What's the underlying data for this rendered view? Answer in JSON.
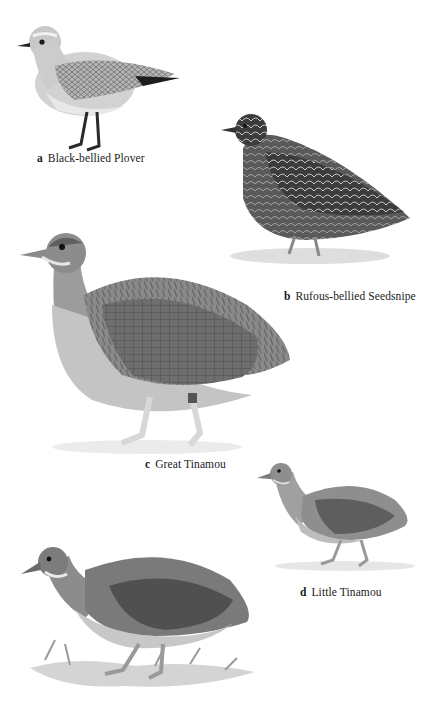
{
  "plate": {
    "background": "#ffffff",
    "style": "grayscale field-guide illustration plate"
  },
  "birds": [
    {
      "letter": "a",
      "name": "Black-bellied Plover",
      "description": "standing shorebird, pale speckled grey plumage, dark legs, black wingtip",
      "body_color": "#bdbdbd",
      "wing_color": "#8a8a8a"
    },
    {
      "letter": "b",
      "name": "Rufous-bellied Seedsnipe",
      "description": "plump bird with dark scalloped feathering standing on ground",
      "body_color": "#4a4a4a",
      "wing_color": "#2e2e2e"
    },
    {
      "letter": "c",
      "name": "Great Tinamou",
      "description": "large rounded ground bird with barred back and pale legs",
      "body_color": "#8c8c8c",
      "wing_color": "#6a6a6a"
    },
    {
      "letter": "d",
      "name": "Little Tinamou",
      "description": "small walking tinamou with darker wing",
      "body_color": "#8e8e8e",
      "wing_color": "#5e5e5e"
    },
    {
      "letter": "",
      "name": "",
      "description": "uncaptioned tinamou walking on grassy ground, dark grey back",
      "body_color": "#7e7e7e",
      "wing_color": "#555555"
    }
  ]
}
